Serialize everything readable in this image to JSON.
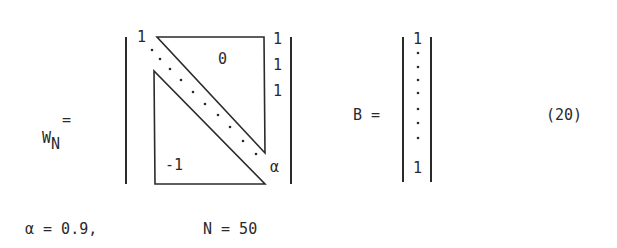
{
  "equation": {
    "number": "(20)",
    "w_matrix": {
      "label_main": "W",
      "label_sub": "N",
      "equals": "=",
      "top_left_entry": "1",
      "upper_region_value": "0",
      "lower_region_value": "-1",
      "last_column_entries": [
        "1",
        "1",
        "1"
      ],
      "bottom_right_entry": "α"
    },
    "b_vector": {
      "label": "B =",
      "top_entry": "1",
      "bottom_entry": "1"
    }
  },
  "parameters": {
    "alpha": "α = 0.9,",
    "n": "N = 50"
  }
}
